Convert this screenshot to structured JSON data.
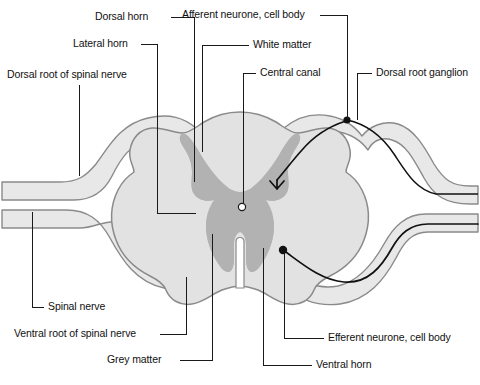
{
  "figure": {
    "background_color": "#ffffff",
    "line_color": "#1a1a1a",
    "white_matter_color": "#e2e2e2",
    "grey_matter_color": "#b2b2b2",
    "nerve_fill_color": "#e8e8e8",
    "outline_color": "#8a8a8a",
    "neurone_color": "#111111"
  },
  "labels": {
    "dorsal_horn": "Dorsal horn",
    "lateral_horn": "Lateral horn",
    "dorsal_root_of_spinal_nerve": "Dorsal root of spinal nerve",
    "afferent_neurone_cell_body": "Afferent neurone, cell body",
    "white_matter": "White matter",
    "central_canal": "Central canal",
    "dorsal_root_ganglion": "Dorsal root ganglion",
    "spinal_nerve": "Spinal nerve",
    "ventral_root_of_spinal_nerve": "Ventral root of spinal nerve",
    "grey_matter": "Grey matter",
    "efferent_neurone_cell_body": "Efferent neurone, cell body",
    "ventral_horn": "Ventral horn"
  },
  "structures": {
    "central_canal_marker": "central-canal-dot",
    "afferent_cell_body_marker": "afferent-cell-body-dot",
    "efferent_cell_body_marker": "efferent-cell-body-dot"
  }
}
